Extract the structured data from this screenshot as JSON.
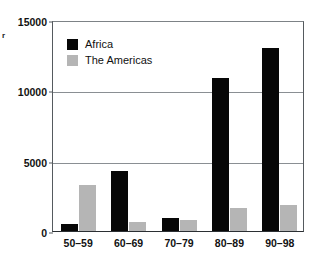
{
  "chart_data": {
    "type": "bar",
    "title": "",
    "subtitle": "",
    "xlabel": "",
    "ylabel": "r",
    "ylabel_note": "y-axis caption is cropped at the left image edge; only a partial glyph is visible",
    "categories": [
      "50–59",
      "60–69",
      "70–79",
      "80–89",
      "90–98"
    ],
    "series": [
      {
        "name": "Africa",
        "color": "#070707",
        "values": [
          480,
          4300,
          960,
          10900,
          13000
        ]
      },
      {
        "name": "The Americas",
        "color": "#b5b5b5",
        "values": [
          3250,
          640,
          760,
          1650,
          1880
        ]
      }
    ],
    "ylim": [
      0,
      15000
    ],
    "yticks": [
      0,
      5000,
      10000,
      15000
    ],
    "ytick_labels": [
      "0",
      "5000",
      "10000",
      "15000"
    ],
    "grid": "horizontal",
    "legend_position": "upper-left-inside"
  },
  "legend": {
    "items": [
      {
        "label": "Africa",
        "swatch": "africa"
      },
      {
        "label": "The Americas",
        "swatch": "americas"
      }
    ]
  },
  "colors": {
    "africa": "#070707",
    "americas": "#b5b5b5",
    "axis": "#555a5e",
    "grid": "#8a8f93",
    "background": "#ffffff"
  }
}
